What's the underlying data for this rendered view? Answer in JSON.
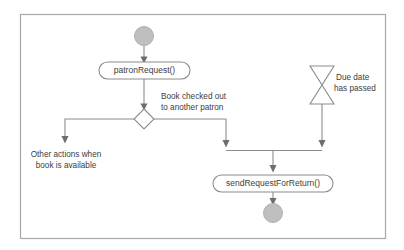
{
  "diagram": {
    "kind": "uml-activity-diagram",
    "canvas": {
      "width": 404,
      "height": 250
    },
    "colors": {
      "background": "#ffffff",
      "frame_stroke": "#a8a8a8",
      "node_fill": "#bfbfbf",
      "shape_fill": "#ffffff",
      "shape_stroke": "#8c8c8c",
      "flow_stroke": "#8c8c8c",
      "arrow_fill": "#6e6e6e",
      "text": "#3d3d3d"
    },
    "frame": {
      "x": 20,
      "y": 14,
      "width": 365,
      "height": 224
    },
    "nodes": [
      {
        "id": "start",
        "type": "initial-node",
        "shape": "filled-circle",
        "label": "",
        "cx": 144,
        "cy": 36,
        "r": 9.5
      },
      {
        "id": "patron-request",
        "type": "action",
        "shape": "rounded-rectangle",
        "label": "patronRequest()",
        "x": 99,
        "y": 62,
        "width": 91,
        "height": 17,
        "rx": 8.5
      },
      {
        "id": "decision",
        "type": "decision",
        "shape": "diamond",
        "label": "",
        "cx": 144,
        "cy": 119,
        "half_width": 10,
        "half_height": 10
      },
      {
        "id": "time-event",
        "type": "time-event",
        "shape": "hourglass",
        "label": "",
        "x": 310,
        "y": 66,
        "width": 24,
        "height": 38
      },
      {
        "id": "send-request",
        "type": "action",
        "shape": "rounded-rectangle",
        "label": "sendRequestForReturn()",
        "x": 213,
        "y": 175,
        "width": 120,
        "height": 17,
        "rx": 8.5
      },
      {
        "id": "end",
        "type": "final-node",
        "shape": "filled-circle",
        "label": "",
        "cx": 273,
        "cy": 213,
        "r": 9.5
      }
    ],
    "edges": [
      {
        "id": "start-to-patron-request",
        "from": "start",
        "to": "patron-request",
        "path": "M 144 45.5 L 144 61",
        "arrow_at": {
          "x": 144,
          "y": 62,
          "dir": "down"
        },
        "label": ""
      },
      {
        "id": "patron-request-to-decision",
        "from": "patron-request",
        "to": "decision",
        "path": "M 144 79 L 144 108",
        "arrow_at": {
          "x": 144,
          "y": 109,
          "dir": "down"
        },
        "label": ""
      },
      {
        "id": "decision-left-branch",
        "from": "decision",
        "to": "other-actions-note",
        "path": "M 134 119 L 65 119 L 65 138",
        "arrow_at": {
          "x": 65,
          "y": 145,
          "dir": "down"
        },
        "label": ""
      },
      {
        "id": "decision-right-branch",
        "from": "decision",
        "to": "merge-bar",
        "path": "M 154 119 L 226 119 L 226 143",
        "arrow_at": {
          "x": 226,
          "y": 150,
          "dir": "down"
        },
        "label": "Book checked out to another patron"
      },
      {
        "id": "time-event-to-merge",
        "from": "time-event",
        "to": "merge-bar",
        "path": "M 322 104 L 322 143",
        "arrow_at": {
          "x": 322,
          "y": 150,
          "dir": "down"
        },
        "label": ""
      },
      {
        "id": "merge-to-send-request",
        "from": "merge-bar",
        "to": "send-request",
        "path": "M 226 151 L 322 151 M 273 151 L 273 167",
        "arrow_at": {
          "x": 273,
          "y": 174,
          "dir": "down"
        },
        "label": ""
      },
      {
        "id": "send-request-to-end",
        "from": "send-request",
        "to": "end",
        "path": "M 273 192 L 273 201",
        "arrow_at": {
          "x": 273,
          "y": 203,
          "dir": "down"
        },
        "label": ""
      }
    ],
    "labels": [
      {
        "id": "guard-checked-out",
        "anchor": "start",
        "x": 160,
        "y": 99,
        "lines": [
          "Book checked out",
          "to another patron"
        ]
      },
      {
        "id": "note-other-actions",
        "anchor": "middle",
        "x": 66,
        "y": 155,
        "lines": [
          "Other actions when",
          "book is available"
        ]
      },
      {
        "id": "note-due-date",
        "anchor": "start",
        "x": 336,
        "y": 78,
        "lines": [
          "Due date",
          "has passed"
        ]
      }
    ],
    "text": {
      "patron_request": "patronRequest()",
      "send_request": "sendRequestForReturn()",
      "guard_line1": "Book checked out",
      "guard_line2": "to another patron",
      "other_line1": "Other actions when",
      "other_line2": "book is available",
      "due_line1": "Due date",
      "due_line2": "has passed"
    }
  }
}
